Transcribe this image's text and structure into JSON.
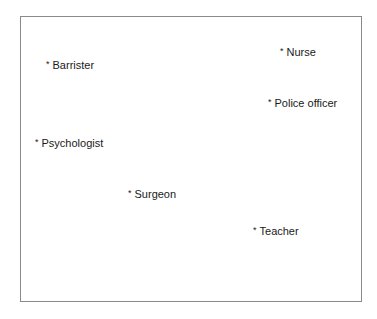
{
  "diagram": {
    "type": "positioned-label-map",
    "marker": "*",
    "items": [
      {
        "label": "Barrister",
        "x": 46,
        "y": 59
      },
      {
        "label": "Nurse",
        "x": 280,
        "y": 46
      },
      {
        "label": "Police officer",
        "x": 268,
        "y": 97
      },
      {
        "label": "Psychologist",
        "x": 35,
        "y": 137
      },
      {
        "label": "Surgeon",
        "x": 128,
        "y": 188
      },
      {
        "label": "Teacher",
        "x": 253,
        "y": 225
      }
    ]
  }
}
